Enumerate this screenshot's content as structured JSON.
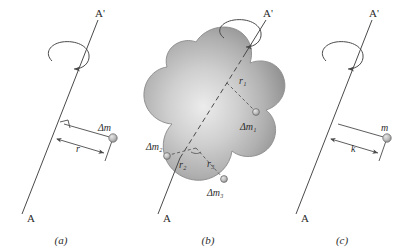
{
  "figure": {
    "panels": [
      {
        "id": "a",
        "caption": "(a)",
        "axis_top_label": "A'",
        "axis_bottom_label": "A",
        "mass_label": "Δm",
        "radius_label": "r",
        "right_angle_marker": true,
        "rotation_arrow": true
      },
      {
        "id": "b",
        "caption": "(b)",
        "axis_top_label": "A'",
        "axis_bottom_label": "A",
        "rotation_arrow": true,
        "body_shape": "irregular-blob",
        "elements": [
          {
            "mass_label": "Δm₁",
            "radius_label": "r₁"
          },
          {
            "mass_label": "Δm₂",
            "radius_label": "r₂"
          },
          {
            "mass_label": "Δm₃",
            "radius_label": "r₃"
          }
        ]
      },
      {
        "id": "c",
        "caption": "(c)",
        "axis_top_label": "A'",
        "axis_bottom_label": "A",
        "mass_label": "m",
        "radius_label": "k",
        "rotation_arrow": true
      }
    ],
    "colors": {
      "background": "#ffffff",
      "line": "#4a4a4a",
      "text": "#2b2b2b",
      "mass_dot_fill": "#b8b8b8",
      "mass_dot_stroke": "#6e6e6e",
      "blob_light": "#e8e8e8",
      "blob_mid": "#b5b5b5",
      "blob_dark": "#8c8c8c",
      "blob_outline": "#8a8a8a"
    }
  }
}
